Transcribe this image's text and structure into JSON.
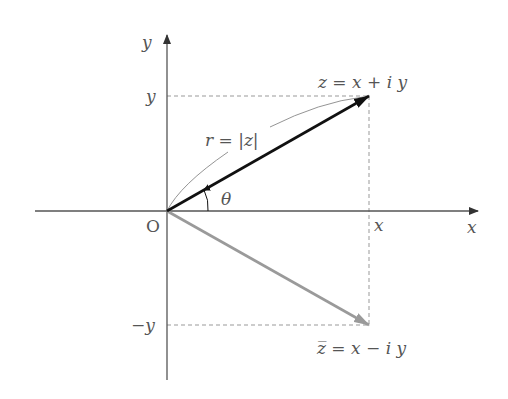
{
  "diagram": {
    "axes": {
      "x_label": "x",
      "y_label": "y",
      "origin_label": "O"
    },
    "ticks": {
      "x_tick": "x",
      "y_tick": "y",
      "neg_y_tick": "−y"
    },
    "vectors": [
      {
        "name": "z",
        "label": "z = x + i y",
        "color": "#111111"
      },
      {
        "name": "z-conjugate",
        "label": "z̅ = x − i y",
        "color": "#999999"
      }
    ],
    "modulus_label": "r = |z|",
    "angle_label": "θ",
    "colors": {
      "axis": "#555555",
      "dashed": "#999999",
      "z_vector": "#111111",
      "conj_vector": "#9a9a9a",
      "text": "#555555"
    }
  }
}
